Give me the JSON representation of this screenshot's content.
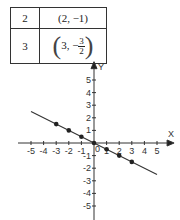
{
  "table": {
    "rows": [
      {
        "x": "2",
        "point": "(2, −1)"
      },
      {
        "x": "3",
        "point_prefix": "3, −",
        "num": "3",
        "den": "2"
      }
    ]
  },
  "chart_data": {
    "type": "line",
    "title": "",
    "xlabel": "X",
    "ylabel": "Y",
    "xlim": [
      -5,
      5
    ],
    "ylim": [
      -5,
      5
    ],
    "x_ticks": [
      "-5",
      "-4",
      "-3",
      "-2",
      "-1",
      "0",
      "1",
      "2",
      "3",
      "4",
      "5"
    ],
    "y_ticks": [
      "5",
      "4",
      "3",
      "2",
      "1",
      "-1",
      "-2",
      "-3",
      "-4",
      "-5"
    ],
    "points": [
      [
        -3,
        1.5
      ],
      [
        -2,
        1
      ],
      [
        -1,
        0.5
      ],
      [
        0,
        0
      ],
      [
        1,
        -0.5
      ],
      [
        2,
        -1
      ],
      [
        3,
        -1.5
      ]
    ],
    "line": {
      "equation": "y = -x/2",
      "x_range": [
        -5,
        5
      ]
    },
    "grid": false
  }
}
